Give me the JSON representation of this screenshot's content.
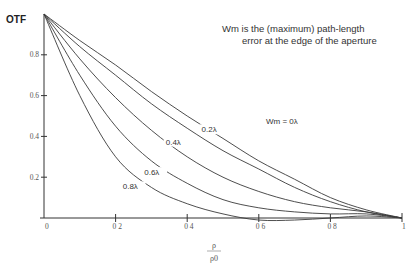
{
  "chart_data": {
    "type": "line",
    "title": "",
    "ylabel": "OTF",
    "xlabel": "ρ / ρ0",
    "xlabel_num": "ρ",
    "xlabel_den": "ρ0",
    "xlim": [
      0,
      1
    ],
    "ylim": [
      0,
      1
    ],
    "grid": false,
    "x_ticks": [
      {
        "value": 0,
        "label": "0"
      },
      {
        "value": 0.2,
        "label": "0 2"
      },
      {
        "value": 0.4,
        "label": "0 4"
      },
      {
        "value": 0.6,
        "label": "0 6"
      },
      {
        "value": 0.8,
        "label": "0 8"
      },
      {
        "value": 1,
        "label": "1"
      }
    ],
    "y_ticks": [
      {
        "value": 0.2,
        "label": "0.2"
      },
      {
        "value": 0.4,
        "label": "0.4"
      },
      {
        "value": 0.6,
        "label": "0.6"
      },
      {
        "value": 0.8,
        "label": "0.8"
      }
    ],
    "annotation": {
      "line1": "Wm is the (maximum) path-length",
      "line2": "error at the edge of the aperture"
    },
    "x": [
      0,
      0.1,
      0.2,
      0.3,
      0.4,
      0.5,
      0.6,
      0.7,
      0.8,
      0.9,
      1.0
    ],
    "series": [
      {
        "name": "Wm = 0λ",
        "label": "Wm = 0λ",
        "values": [
          1.0,
          0.87,
          0.75,
          0.62,
          0.5,
          0.39,
          0.28,
          0.19,
          0.1,
          0.04,
          0.0
        ]
      },
      {
        "name": "0.2λ",
        "label": "0.2λ",
        "values": [
          1.0,
          0.84,
          0.7,
          0.56,
          0.44,
          0.33,
          0.24,
          0.15,
          0.08,
          0.03,
          0.0
        ]
      },
      {
        "name": "0.4λ",
        "label": "0.4λ",
        "values": [
          1.0,
          0.78,
          0.59,
          0.43,
          0.3,
          0.2,
          0.13,
          0.08,
          0.05,
          0.03,
          0.0
        ]
      },
      {
        "name": "0.6λ",
        "label": "0.6λ",
        "values": [
          1.0,
          0.7,
          0.45,
          0.28,
          0.17,
          0.09,
          0.05,
          0.03,
          0.02,
          0.02,
          0.0
        ]
      },
      {
        "name": "0.8λ",
        "label": "0.8λ",
        "values": [
          1.0,
          0.6,
          0.3,
          0.15,
          0.07,
          0.02,
          -0.01,
          -0.01,
          0.0,
          0.01,
          0.0
        ]
      }
    ],
    "curve_label_positions": [
      {
        "x": 0.62,
        "y": 0.46
      },
      {
        "x": 0.44,
        "y": 0.42
      },
      {
        "x": 0.34,
        "y": 0.36
      },
      {
        "x": 0.28,
        "y": 0.21
      },
      {
        "x": 0.22,
        "y": 0.14
      }
    ]
  }
}
